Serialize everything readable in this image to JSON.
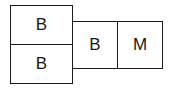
{
  "diagram": {
    "cells": [
      {
        "id": "top-left",
        "label": "B"
      },
      {
        "id": "bottom-left",
        "label": "B"
      },
      {
        "id": "middle",
        "label": "B"
      },
      {
        "id": "right",
        "label": "M"
      }
    ],
    "colors": {
      "stroke": "#1a1a1a",
      "fill": "#ffffff",
      "text": "#1a1a1a"
    }
  }
}
